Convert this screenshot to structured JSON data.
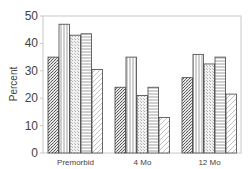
{
  "chart_data": {
    "type": "bar",
    "title": "",
    "xlabel": "",
    "ylabel": "Percent",
    "ylim": [
      0,
      50
    ],
    "yticks": [
      0,
      10,
      20,
      30,
      40,
      50
    ],
    "categories": [
      "Premorbid",
      "4 Mo",
      "12 Mo"
    ],
    "grid": false,
    "legend": null,
    "series": [
      {
        "name": "Series 1",
        "pattern": "crosshatch",
        "values": [
          35,
          24,
          27.5
        ]
      },
      {
        "name": "Series 2",
        "pattern": "vertical-lines",
        "values": [
          47,
          35,
          36
        ]
      },
      {
        "name": "Series 3",
        "pattern": "stipple",
        "values": [
          43,
          21,
          32.5
        ]
      },
      {
        "name": "Series 4",
        "pattern": "horizontal-lines",
        "values": [
          43.5,
          24,
          35
        ]
      },
      {
        "name": "Series 5",
        "pattern": "diagonal-lines",
        "values": [
          30.5,
          13,
          21.5
        ]
      }
    ]
  },
  "colors": {
    "frame": "#c8c8c8",
    "bar_outline": "#444444",
    "pattern": "#666666"
  }
}
